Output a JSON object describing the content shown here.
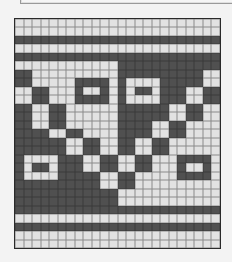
{
  "pattern": {
    "cols": 24,
    "rows": 27,
    "colors": {
      "light": "#e2e2e2",
      "dark": "#505050",
      "grid_line": "#8a8a8a",
      "border": "#2a2a2a"
    },
    "cells": [
      "000000000000000000000000",
      "000000000000000000000000",
      "111111111111111111111111",
      "000000000000000000000000",
      "111111111111111111111111",
      "000000000000111111111111",
      "110000000000111111111100",
      "110000011110100001111100",
      "001100010010101101110011",
      "001100011110100001110011",
      "110011000000111111001100",
      "110011000000111111001100",
      "110011000000111100110000",
      "111100110000111100110000",
      "111111001100110011000000",
      "111111001100110011000000",
      "100001110011001100011110",
      "101101110011001100010010",
      "100001111100110000011110",
      "111111111100110000000000",
      "111111111111000000000000",
      "111111111111000000000000",
      "111111111111111111111111",
      "000000000000000000000000",
      "111111111111111111111111",
      "000000000000000000000000",
      "000000000000000000000000"
    ]
  }
}
